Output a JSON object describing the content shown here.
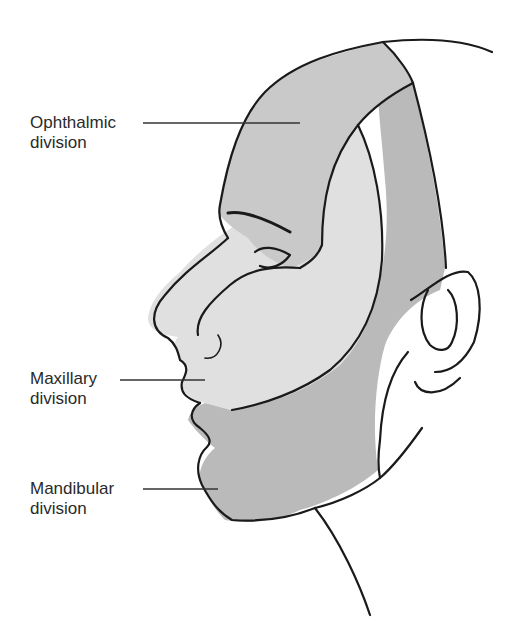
{
  "figure": {
    "colors": {
      "ophthalmic": "#c9c9c9",
      "maxillary": "#e0e0e0",
      "mandibular": "#bababa",
      "outline": "#1a1a1a",
      "background": "#ffffff"
    }
  },
  "labels": [
    {
      "line1": "Ophthalmic",
      "line2": "division"
    },
    {
      "line1": "Maxillary",
      "line2": "division"
    },
    {
      "line1": "Mandibular",
      "line2": "division"
    }
  ]
}
